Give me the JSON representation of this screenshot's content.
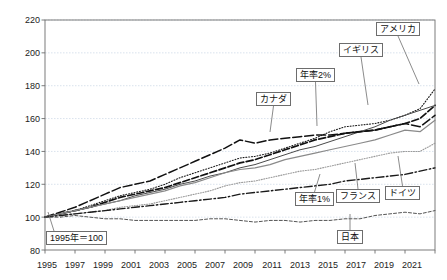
{
  "chart_data": {
    "type": "line",
    "title": "",
    "subtitle": "",
    "xlabel": "",
    "ylabel": "",
    "xlim": [
      1995,
      2021
    ],
    "ylim": [
      80,
      220
    ],
    "yticks": [
      80,
      100,
      120,
      140,
      160,
      180,
      200,
      220
    ],
    "xticks": [
      1995,
      1997,
      1999,
      2001,
      2003,
      2005,
      2007,
      2009,
      2011,
      2013,
      2015,
      2017,
      2019,
      2021
    ],
    "grid": true,
    "legend": "inline-callouts",
    "base_note": "1995年＝100",
    "x": [
      1995,
      1996,
      1997,
      1998,
      1999,
      2000,
      2001,
      2002,
      2003,
      2004,
      2005,
      2006,
      2007,
      2008,
      2009,
      2010,
      2011,
      2012,
      2013,
      2014,
      2015,
      2016,
      2017,
      2018,
      2019,
      2020,
      2021
    ],
    "series": [
      {
        "name": "アメリカ",
        "style": "dotted",
        "values": [
          100,
          102,
          104,
          107,
          110,
          113,
          115,
          117,
          120,
          124,
          127,
          130,
          133,
          136,
          137,
          139,
          142,
          145,
          148,
          152,
          155,
          156,
          157,
          159,
          162,
          166,
          178
        ]
      },
      {
        "name": "イギリス",
        "style": "long-dash",
        "values": [
          100,
          102,
          104,
          106,
          109,
          112,
          114,
          116,
          118,
          121,
          124,
          127,
          130,
          133,
          135,
          138,
          141,
          144,
          147,
          149,
          151,
          152,
          153,
          155,
          157,
          160,
          168
        ]
      },
      {
        "name": "年率2%",
        "style": "solid-thin",
        "values": [
          100,
          102,
          104,
          106,
          108,
          110,
          113,
          115,
          117,
          120,
          122,
          125,
          127,
          130,
          132,
          135,
          138,
          141,
          143,
          146,
          149,
          152,
          155,
          159,
          162,
          165,
          168
        ]
      },
      {
        "name": "カナダ",
        "style": "dash-long2",
        "values": [
          100,
          103,
          106,
          110,
          114,
          118,
          120,
          122,
          126,
          130,
          134,
          138,
          142,
          147,
          145,
          147,
          148,
          149,
          150,
          150,
          151,
          152,
          153,
          155,
          157,
          155,
          162
        ]
      },
      {
        "name": "フランス",
        "style": "solid-gray",
        "values": [
          100,
          102,
          104,
          106,
          108,
          110,
          112,
          114,
          116,
          119,
          121,
          124,
          127,
          129,
          130,
          132,
          135,
          137,
          139,
          141,
          143,
          145,
          147,
          150,
          153,
          152,
          159
        ]
      },
      {
        "name": "ドイツ",
        "style": "dotted-gray",
        "values": [
          100,
          101,
          102,
          103,
          104,
          106,
          107,
          108,
          110,
          112,
          114,
          116,
          119,
          121,
          122,
          124,
          126,
          128,
          129,
          131,
          133,
          135,
          137,
          139,
          140,
          140,
          145
        ]
      },
      {
        "name": "年率1%",
        "style": "dash-dot",
        "values": [
          100,
          101,
          102,
          103,
          104,
          105,
          106,
          107,
          108,
          109,
          110,
          111,
          112,
          114,
          115,
          116,
          117,
          118,
          119,
          120,
          122,
          123,
          124,
          125,
          126,
          128,
          130
        ]
      },
      {
        "name": "日本",
        "style": "short-dash",
        "values": [
          100,
          100,
          101,
          100,
          99,
          99,
          98,
          98,
          98,
          98,
          98,
          99,
          99,
          98,
          97,
          98,
          98,
          97,
          98,
          98,
          99,
          99,
          101,
          102,
          103,
          102,
          104
        ]
      }
    ],
    "callouts": [
      {
        "label": "アメリカ",
        "left": 376,
        "top": 22,
        "anchor_x": 419,
        "anchor_y": 84
      },
      {
        "label": "イギリス",
        "left": 339,
        "top": 43,
        "anchor_x": 368,
        "anchor_y": 105
      },
      {
        "label": "年率2%",
        "left": 296,
        "top": 68,
        "anchor_x": 317,
        "anchor_y": 126
      },
      {
        "label": "カナダ",
        "left": 256,
        "top": 92,
        "anchor_x": 270,
        "anchor_y": 132
      },
      {
        "label": "年率1%",
        "left": 295,
        "top": 192,
        "anchor_x": 320,
        "anchor_y": 174
      },
      {
        "label": "フランス",
        "left": 336,
        "top": 189,
        "anchor_x": 355,
        "anchor_y": 163
      },
      {
        "label": "ドイツ",
        "left": 385,
        "top": 186,
        "anchor_x": 398,
        "anchor_y": 156
      },
      {
        "label": "日本",
        "left": 337,
        "top": 230,
        "anchor_x": 350,
        "anchor_y": 214
      }
    ]
  },
  "axis": {
    "y_tick_labels": [
      "220",
      "200",
      "180",
      "160",
      "140",
      "120",
      "100",
      "80"
    ],
    "x_tick_labels": [
      "1995",
      "1997",
      "1999",
      "2001",
      "2003",
      "2005",
      "2007",
      "2009",
      "2011",
      "2013",
      "2015",
      "2017",
      "2019",
      "2021"
    ]
  },
  "annotations": {
    "base_year_note": "1995年＝100"
  },
  "colors": {
    "frame": "#6d6d6d",
    "grid": "#c9d6e4",
    "ink": "#111111",
    "gray_series": "#8a8a8a"
  }
}
